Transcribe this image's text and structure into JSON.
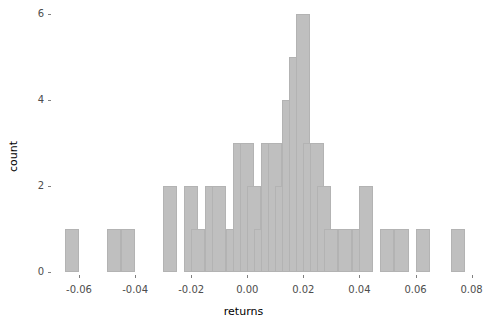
{
  "chart_data": {
    "type": "bar",
    "chart_subtype": "histogram",
    "title": "",
    "xlabel": "returns",
    "ylabel": "count",
    "xlim": [
      -0.0675,
      0.0805
    ],
    "ylim": [
      0,
      6
    ],
    "bin_width": 0.005,
    "grid": false,
    "legend": null,
    "bar_color": "#bfbfbf",
    "bar_border_color": "#b3b3b3",
    "background_color": "#ffffff",
    "x_ticks": [
      -0.06,
      -0.04,
      -0.02,
      0.0,
      0.02,
      0.04,
      0.06,
      0.08
    ],
    "x_tick_labels": [
      "-0.06",
      "-0.04",
      "-0.02",
      "0.00",
      "0.02",
      "0.04",
      "0.06",
      "0.08"
    ],
    "y_ticks": [
      0,
      2,
      4,
      6
    ],
    "y_tick_labels": [
      "0",
      "2",
      "4",
      "6"
    ],
    "bins": [
      {
        "x0": -0.065,
        "count": 1
      },
      {
        "x0": -0.06,
        "count": 0
      },
      {
        "x0": -0.055,
        "count": 0
      },
      {
        "x0": -0.05,
        "count": 1
      },
      {
        "x0": -0.045,
        "count": 1
      },
      {
        "x0": -0.04,
        "count": 0
      },
      {
        "x0": -0.035,
        "count": 0
      },
      {
        "x0": -0.03,
        "count": 2
      },
      {
        "x0": -0.025,
        "count": 0
      },
      {
        "x0": -0.0225,
        "count": 2
      },
      {
        "x0": -0.02,
        "count": 1
      },
      {
        "x0": -0.015,
        "count": 2
      },
      {
        "x0": -0.0125,
        "count": 2
      },
      {
        "x0": -0.0075,
        "count": 1
      },
      {
        "x0": -0.005,
        "count": 3
      },
      {
        "x0": -0.0025,
        "count": 3
      },
      {
        "x0": 0.0,
        "count": 2
      },
      {
        "x0": 0.0025,
        "count": 1
      },
      {
        "x0": 0.005,
        "count": 3
      },
      {
        "x0": 0.0075,
        "count": 3
      },
      {
        "x0": 0.01,
        "count": 2
      },
      {
        "x0": 0.0125,
        "count": 4
      },
      {
        "x0": 0.015,
        "count": 5
      },
      {
        "x0": 0.0175,
        "count": 6
      },
      {
        "x0": 0.02,
        "count": 3
      },
      {
        "x0": 0.0225,
        "count": 3
      },
      {
        "x0": 0.025,
        "count": 2
      },
      {
        "x0": 0.0275,
        "count": 1
      },
      {
        "x0": 0.0325,
        "count": 1
      },
      {
        "x0": 0.0375,
        "count": 1
      },
      {
        "x0": 0.04,
        "count": 2
      },
      {
        "x0": 0.0475,
        "count": 1
      },
      {
        "x0": 0.0525,
        "count": 1
      },
      {
        "x0": 0.06,
        "count": 1
      },
      {
        "x0": 0.0725,
        "count": 1
      }
    ]
  }
}
